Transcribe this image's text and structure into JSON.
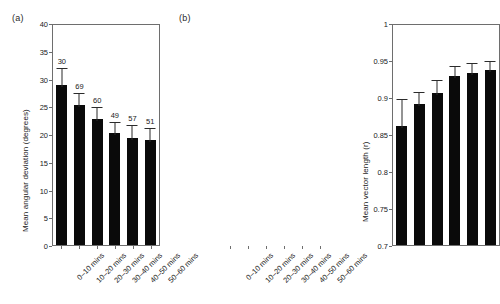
{
  "figure": {
    "panels": [
      {
        "tag": "(a)",
        "ylabel": "Mean angular deviation (degrees)"
      },
      {
        "tag": "(b)",
        "ylabel": "Mean vector length (r)"
      }
    ]
  },
  "chart_data": [
    {
      "type": "bar",
      "title": "(a)",
      "xlabel": "",
      "ylabel": "Mean angular deviation (degrees)",
      "categories": [
        "0–10 mins",
        "10–20 mins",
        "20–30 mins",
        "30–40 mins",
        "40–50 mins",
        "50–60 mins"
      ],
      "values": [
        28.8,
        25.3,
        22.7,
        20.1,
        19.3,
        19.0
      ],
      "errors_upper": [
        3.4,
        2.4,
        2.6,
        2.4,
        2.7,
        2.4
      ],
      "point_labels": [
        "30",
        "69",
        "60",
        "49",
        "57",
        "51"
      ],
      "ylim": [
        0,
        40
      ],
      "yticks": [
        "0",
        "5",
        "10",
        "15",
        "20",
        "25",
        "30",
        "35",
        "40"
      ],
      "ytick_values": [
        0,
        5,
        10,
        15,
        20,
        25,
        30,
        35,
        40
      ],
      "grid": false,
      "legend": "none",
      "bar_color": "#0a0a0a"
    },
    {
      "type": "bar",
      "title": "(b)",
      "xlabel": "",
      "ylabel": "Mean vector length (r)",
      "categories": [
        "0–10 mins",
        "10–20 mins",
        "20–30 mins",
        "30–40 mins",
        "40–50 mins",
        "50–60 mins"
      ],
      "values": [
        0.861,
        0.89,
        0.906,
        0.928,
        0.932,
        0.936
      ],
      "errors_upper": [
        0.039,
        0.019,
        0.02,
        0.016,
        0.016,
        0.016
      ],
      "ylim": [
        0.7,
        1.0
      ],
      "yticks": [
        "0.7",
        "0.75",
        "0.8",
        "0.85",
        "0.9",
        "0.95",
        "1"
      ],
      "ytick_values": [
        0.7,
        0.75,
        0.8,
        0.85,
        0.9,
        0.95,
        1.0
      ],
      "grid": false,
      "legend": "none",
      "bar_color": "#0a0a0a"
    }
  ]
}
